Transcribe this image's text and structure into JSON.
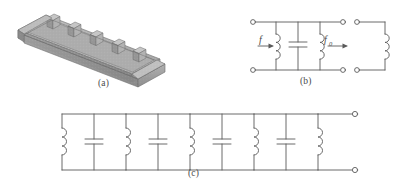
{
  "figure": {
    "background_color": "#ffffff",
    "line_color": "#5a5a5a",
    "text_color": "#4a4a4a"
  },
  "panels": [
    {
      "id": "a",
      "caption": "(a)",
      "type": "isometric-waveguide",
      "description": "Rectangular waveguide with inductive iris diaphragms forming coupled cavities",
      "iris_count": 5,
      "cavity_count": 4,
      "metal_fill": "#9a9a9a",
      "top_face_fill": "#b4b4b4",
      "front_face_fill": "#8c8c8c",
      "side_face_fill": "#a5a5a5"
    },
    {
      "id": "b",
      "caption": "(b)",
      "type": "equivalent-circuit",
      "elements": [
        {
          "name": "terminal-top-left",
          "kind": "terminal"
        },
        {
          "name": "terminal-bottom-left",
          "kind": "terminal"
        },
        {
          "name": "shunt-inductor-left",
          "kind": "inductor"
        },
        {
          "name": "shunt-capacitor-center",
          "kind": "capacitor"
        },
        {
          "name": "shunt-inductor-right",
          "kind": "inductor"
        },
        {
          "name": "terminal-top-right",
          "kind": "terminal"
        },
        {
          "name": "terminal-bottom-right",
          "kind": "terminal"
        },
        {
          "name": "next-section-inductor",
          "kind": "inductor"
        },
        {
          "name": "terminal-next-top",
          "kind": "terminal"
        },
        {
          "name": "terminal-next-bottom",
          "kind": "terminal"
        }
      ],
      "labels": {
        "input_flux": "f",
        "output_flux": "f",
        "output_flux_subscript": "0"
      }
    },
    {
      "id": "c",
      "caption": "(c)",
      "type": "ladder-network",
      "section_count": 4,
      "description": "Cascaded shunt LC resonator sections terminated by a shunt inductor and an output port",
      "elements": [
        {
          "name": "resonator-section-1",
          "kind": "lc-section"
        },
        {
          "name": "resonator-section-2",
          "kind": "lc-section"
        },
        {
          "name": "resonator-section-3",
          "kind": "lc-section"
        },
        {
          "name": "resonator-section-4",
          "kind": "lc-section"
        },
        {
          "name": "output-inductor",
          "kind": "inductor"
        },
        {
          "name": "terminal-output-top",
          "kind": "terminal"
        },
        {
          "name": "terminal-output-bottom",
          "kind": "terminal"
        }
      ]
    }
  ]
}
